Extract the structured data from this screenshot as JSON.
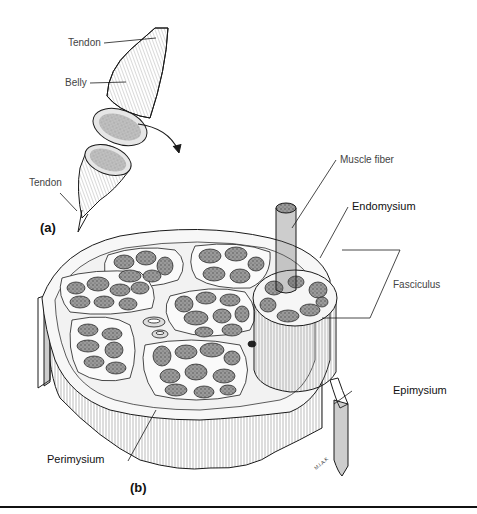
{
  "figure": {
    "panel_a": {
      "letter": "(a)",
      "labels": {
        "tendon_top": "Tendon",
        "belly": "Belly",
        "tendon_bottom": "Tendon"
      }
    },
    "panel_b": {
      "letter": "(b)",
      "labels": {
        "muscle_fiber": "Muscle fiber",
        "endomysium": "Endomysium",
        "fasciculus": "Fasciculus",
        "epimysium": "Epimysium",
        "perimysium": "Perimysium"
      }
    },
    "artist_signature": "M.I.A.K",
    "colors": {
      "ink": "#1a1a1a",
      "fiber_fill": "#8a8a8a",
      "tissue_fill": "#f4f4f4",
      "label_text": "#444444",
      "background": "#ffffff"
    }
  }
}
